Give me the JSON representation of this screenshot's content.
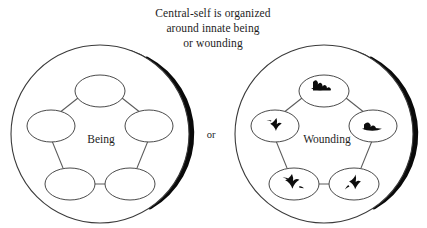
{
  "figure": {
    "caption_lines": [
      "Central-self is organized",
      "around innate being",
      "or wounding"
    ],
    "conjunction": "or",
    "background_color": "#ffffff",
    "stroke_color": "#3a3a3a",
    "shadow_color": "#0a0a0a",
    "mark_color": "#0d0d0d"
  },
  "diagrams": [
    {
      "id": "being-diagram",
      "center_label": "Being",
      "node_count": 5,
      "nodes": [
        {
          "position": "top",
          "mark": null
        },
        {
          "position": "upper-right",
          "mark": null
        },
        {
          "position": "lower-right",
          "mark": null
        },
        {
          "position": "lower-left",
          "mark": null
        },
        {
          "position": "upper-left",
          "mark": null
        }
      ]
    },
    {
      "id": "wounding-diagram",
      "center_label": "Wounding",
      "node_count": 5,
      "nodes": [
        {
          "position": "top",
          "mark": "wound-blot"
        },
        {
          "position": "upper-right",
          "mark": "wound-blot"
        },
        {
          "position": "lower-right",
          "mark": "wound-blot"
        },
        {
          "position": "lower-left",
          "mark": "wound-blot"
        },
        {
          "position": "upper-left",
          "mark": "wound-blot"
        }
      ]
    }
  ]
}
